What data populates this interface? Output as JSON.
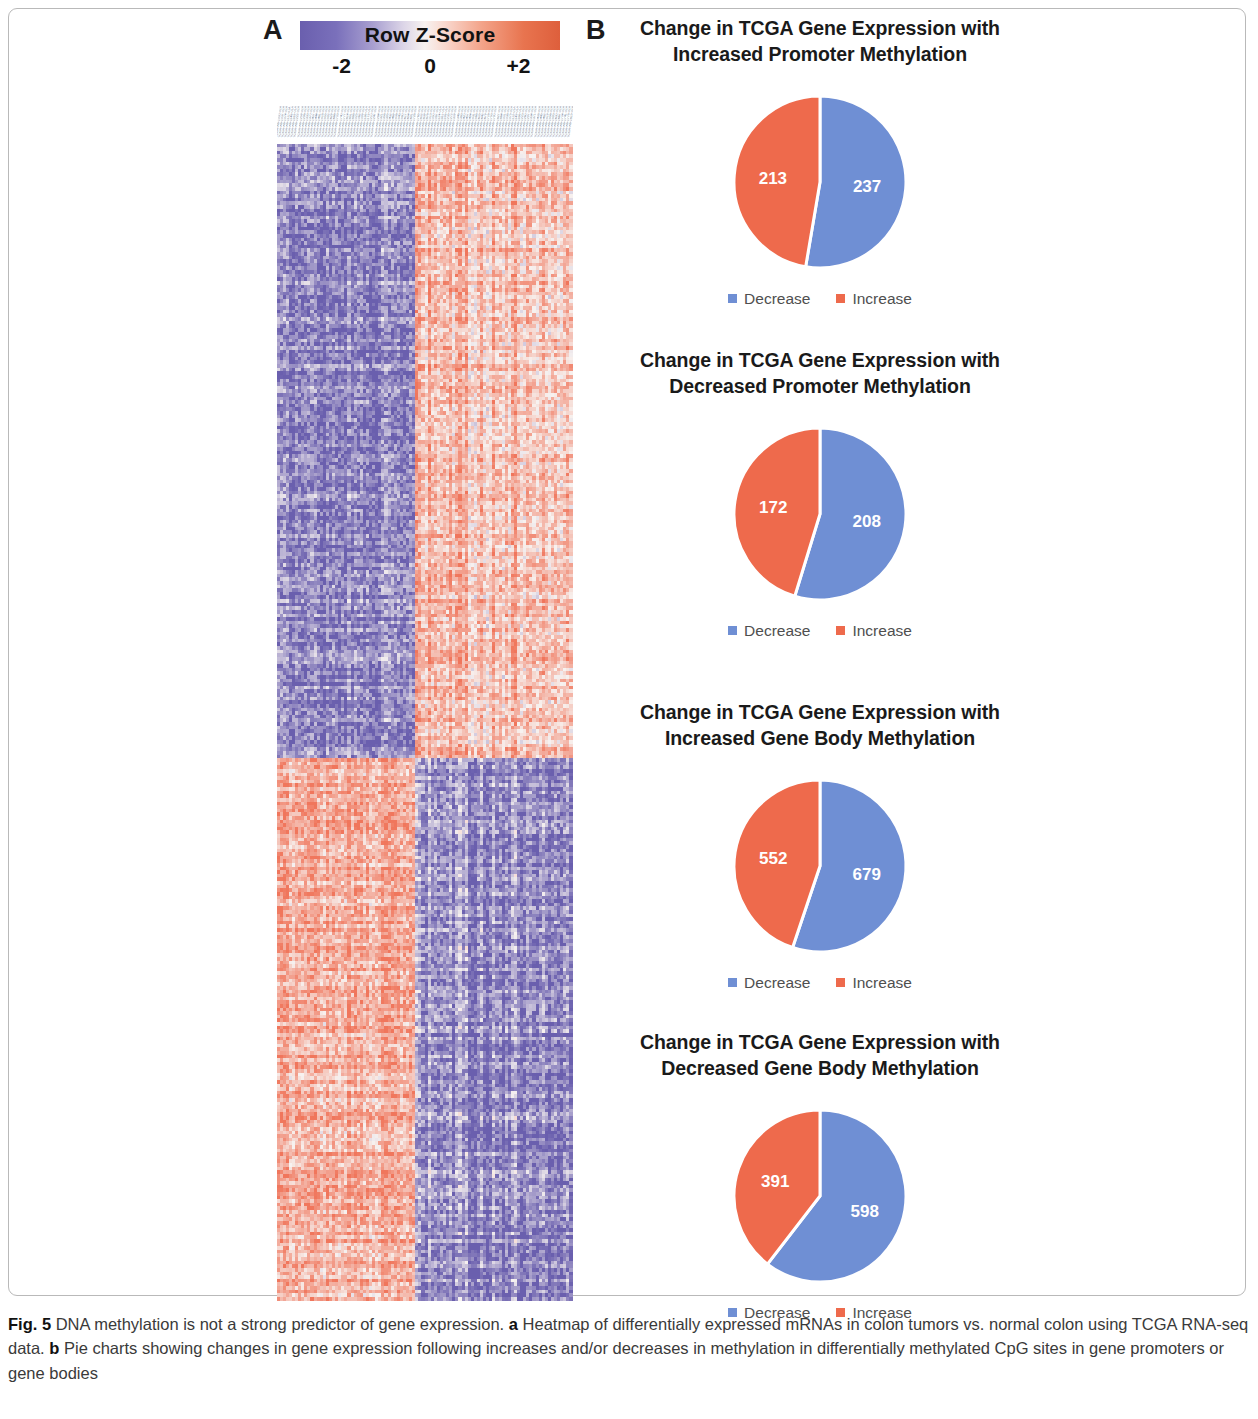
{
  "figure": {
    "panel_a_letter": "A",
    "panel_b_letter": "B"
  },
  "colorbar": {
    "title": "Row Z-Score",
    "tick_low": "-2",
    "tick_mid": "0",
    "tick_high": "+2",
    "color_low": "#6a5fae",
    "color_mid": "#f7f2f0",
    "color_high": "#de5f3c"
  },
  "legend": {
    "decrease_label": "Decrease",
    "increase_label": "Increase",
    "decrease_color": "#6f8fd4",
    "increase_color": "#ee6a4c"
  },
  "caption": {
    "fig_label": "Fig. 5",
    "text_1": " DNA methylation is not a strong predictor of gene expression. ",
    "a_label": "a",
    "text_2": " Heatmap of differentially expressed mRNAs in colon tumors vs. normal colon using TCGA RNA-seq data. ",
    "b_label": "b",
    "text_3": " Pie charts showing changes in gene expression following increases and/or decreases in methylation in differentially methylated CpG sites in gene promoters or gene bodies"
  },
  "chart_data": [
    {
      "type": "heatmap",
      "title": "Row Z-Score",
      "colorbar_label": "Row Z-Score",
      "colorbar_ticks": [
        "-2",
        "0",
        "+2"
      ],
      "zlim": [
        -2,
        2
      ],
      "xlabel": "TCGA samples (colon tumor vs. normal)",
      "ylabel": "Differentially expressed mRNAs",
      "n_columns": 96,
      "n_rows": 320,
      "column_groups": [
        {
          "name": "Group 1 (left, ~47% of columns)",
          "fraction": 0.47
        },
        {
          "name": "Group 2 (right, ~53% of columns)",
          "fraction": 0.53
        }
      ],
      "row_blocks": [
        {
          "name": "Upper block (~53% of rows)",
          "fraction": 0.53,
          "left_group_z": -1.4,
          "right_group_z": 0.9
        },
        {
          "name": "Lower block (~47% of rows)",
          "fraction": 0.47,
          "left_group_z": 1.1,
          "right_group_z": -1.3
        }
      ],
      "grid": false,
      "legend_position": "top"
    },
    {
      "type": "pie",
      "title": "Change in TCGA Gene Expression with Increased Promoter Methylation",
      "title_line_1": "Change in TCGA Gene Expression with",
      "title_line_2": "Increased Promoter Methylation",
      "labels": [
        "Decrease",
        "Increase"
      ],
      "values": [
        237,
        213
      ],
      "colors": [
        "#6f8fd4",
        "#ee6a4c"
      ],
      "total": 450,
      "start_angle_deg": 0,
      "direction": "clockwise",
      "legend_position": "bottom"
    },
    {
      "type": "pie",
      "title": "Change in TCGA Gene Expression with Decreased Promoter Methylation",
      "title_line_1": "Change in TCGA Gene Expression with",
      "title_line_2": "Decreased Promoter Methylation",
      "labels": [
        "Decrease",
        "Increase"
      ],
      "values": [
        208,
        172
      ],
      "colors": [
        "#6f8fd4",
        "#ee6a4c"
      ],
      "total": 380,
      "start_angle_deg": 0,
      "direction": "clockwise",
      "legend_position": "bottom"
    },
    {
      "type": "pie",
      "title": "Change in TCGA Gene Expression with Increased Gene Body Methylation",
      "title_line_1": "Change in TCGA Gene Expression with",
      "title_line_2": "Increased Gene Body Methylation",
      "labels": [
        "Decrease",
        "Increase"
      ],
      "values": [
        679,
        552
      ],
      "colors": [
        "#6f8fd4",
        "#ee6a4c"
      ],
      "total": 1231,
      "start_angle_deg": 0,
      "direction": "clockwise",
      "legend_position": "bottom"
    },
    {
      "type": "pie",
      "title": "Change in TCGA Gene Expression with Decreased Gene Body Methylation",
      "title_line_1": "Change in TCGA Gene Expression with",
      "title_line_2": "Decreased Gene Body Methylation",
      "labels": [
        "Decrease",
        "Increase"
      ],
      "values": [
        598,
        391
      ],
      "colors": [
        "#6f8fd4",
        "#ee6a4c"
      ],
      "total": 989,
      "start_angle_deg": 0,
      "direction": "clockwise",
      "legend_position": "bottom"
    }
  ],
  "pies": [
    {
      "title_line_1": "Change in TCGA Gene Expression with",
      "title_line_2": "Increased Promoter Methylation",
      "decrease_value": "237",
      "increase_value": "213"
    },
    {
      "title_line_1": "Change in TCGA Gene Expression with",
      "title_line_2": "Decreased Promoter Methylation",
      "decrease_value": "208",
      "increase_value": "172"
    },
    {
      "title_line_1": "Change in TCGA Gene Expression with",
      "title_line_2": "Increased Gene Body Methylation",
      "decrease_value": "679",
      "increase_value": "552"
    },
    {
      "title_line_1": "Change in TCGA Gene Expression with",
      "title_line_2": "Decreased Gene Body Methylation",
      "decrease_value": "598",
      "increase_value": "391"
    }
  ]
}
